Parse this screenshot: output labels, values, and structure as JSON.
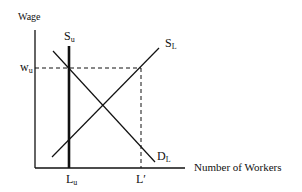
{
  "diagram": {
    "axes": {
      "y_label": "Wage",
      "x_label": "Number of Workers"
    },
    "curves": [
      {
        "id": "S_u",
        "label_main": "S",
        "label_sub": "u",
        "type": "vertical",
        "style": "thick"
      },
      {
        "id": "S_L",
        "label_main": "S",
        "label_sub": "L",
        "type": "upward-sloping"
      },
      {
        "id": "D_L",
        "label_main": "D",
        "label_sub": "L",
        "type": "downward-sloping"
      }
    ],
    "markers": {
      "wage": {
        "main": "w",
        "sub": "u"
      },
      "lu": {
        "main": "L",
        "sub": "u"
      },
      "lprime": {
        "main": "L",
        "sup": "′"
      }
    },
    "colors": {
      "line": "#111111",
      "background": "#ffffff"
    }
  }
}
